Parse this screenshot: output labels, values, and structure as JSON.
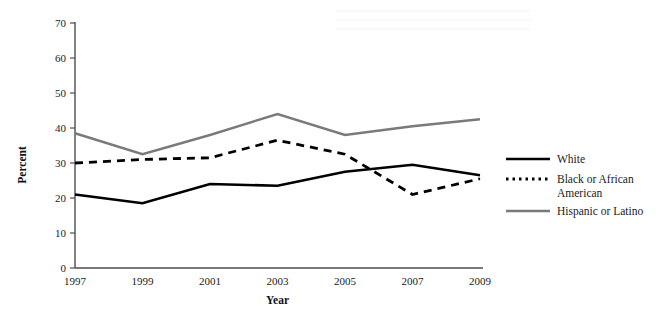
{
  "chart_data": {
    "type": "line",
    "title": "",
    "xlabel": "Year",
    "ylabel": "Percent",
    "x": [
      1997,
      1999,
      2001,
      2003,
      2005,
      2007,
      2009
    ],
    "xtick_labels": [
      "1997",
      "1999",
      "2001",
      "2003",
      "2005",
      "2007",
      "2009"
    ],
    "ytick_labels": [
      "0",
      "10",
      "20",
      "30",
      "40",
      "50",
      "60",
      "70"
    ],
    "yticks": [
      0,
      10,
      20,
      30,
      40,
      50,
      60,
      70
    ],
    "ylim": [
      0,
      70
    ],
    "xlim": [
      1997,
      2009
    ],
    "grid": false,
    "legend_position": "right",
    "series": [
      {
        "name": "White",
        "style": "solid",
        "color": "#000000",
        "width": 2.6,
        "values": [
          21,
          18.5,
          24,
          23.5,
          27.5,
          29.5,
          26.5
        ]
      },
      {
        "name": "Black or African American",
        "style": "dotted",
        "color": "#000000",
        "width": 2.8,
        "values": [
          30,
          31,
          31.5,
          36.5,
          32.5,
          21,
          25.5
        ]
      },
      {
        "name": "Hispanic or Latino",
        "style": "solid",
        "color": "#7a7a7a",
        "width": 2.4,
        "values": [
          38.5,
          32.5,
          38,
          44,
          38,
          40.5,
          42.5
        ]
      }
    ]
  },
  "legend": {
    "entries": [
      {
        "label": "White"
      },
      {
        "label": "Black or African",
        "label2": "American"
      },
      {
        "label": "Hispanic or Latino"
      }
    ]
  }
}
